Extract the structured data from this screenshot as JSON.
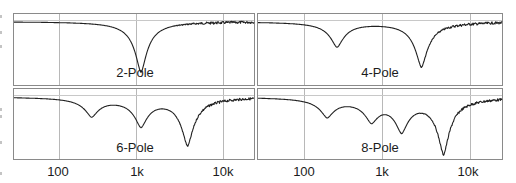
{
  "chart_data": {
    "type": "line",
    "layout": "2x2 grid of frequency-response panels",
    "x_scale": "log",
    "x_range_hz": [
      30,
      22000
    ],
    "x_ticks": [
      {
        "label": "100",
        "hz": 100
      },
      {
        "label": "1k",
        "hz": 1000
      },
      {
        "label": "10k",
        "hz": 10000
      }
    ],
    "grid": true,
    "reference_line": "0 dB (flat) horizontal line near top of each panel",
    "panels": [
      {
        "title": "2-Pole",
        "notches": [
          {
            "hz": 1000,
            "depth_rel": 0.82
          }
        ],
        "hf_noise": true
      },
      {
        "title": "4-Pole",
        "notches": [
          {
            "hz": 250,
            "depth_rel": 0.4
          },
          {
            "hz": 2600,
            "depth_rel": 0.73
          }
        ],
        "hf_noise": true
      },
      {
        "title": "6-Pole",
        "notches": [
          {
            "hz": 250,
            "depth_rel": 0.3
          },
          {
            "hz": 1000,
            "depth_rel": 0.45
          },
          {
            "hz": 3700,
            "depth_rel": 0.78
          }
        ],
        "hf_noise": true
      },
      {
        "title": "8-Pole",
        "notches": [
          {
            "hz": 190,
            "depth_rel": 0.3
          },
          {
            "hz": 650,
            "depth_rel": 0.34
          },
          {
            "hz": 1500,
            "depth_rel": 0.5
          },
          {
            "hz": 4800,
            "depth_rel": 0.9
          }
        ],
        "hf_noise": true
      }
    ]
  },
  "labels": {
    "p0": "2-Pole",
    "p1": "4-Pole",
    "p2": "6-Pole",
    "p3": "8-Pole",
    "tick_100": "100",
    "tick_1k": "1k",
    "tick_10k": "10k"
  }
}
